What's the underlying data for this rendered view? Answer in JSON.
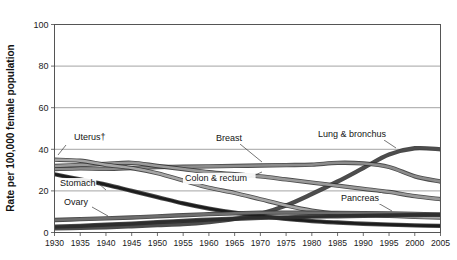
{
  "chart_data": {
    "type": "line",
    "title": "",
    "xlabel": "",
    "ylabel": "Rate per 100,000 female population",
    "xlim": [
      1930,
      2005
    ],
    "ylim": [
      0,
      100
    ],
    "yticks": [
      0,
      20,
      40,
      60,
      80,
      100
    ],
    "xticks": [
      1930,
      1935,
      1940,
      1945,
      1950,
      1955,
      1960,
      1965,
      1970,
      1975,
      1980,
      1985,
      1990,
      1995,
      2000,
      2005
    ],
    "grid": true,
    "legend_position": "in-plot-labels",
    "x": [
      1930,
      1935,
      1940,
      1945,
      1950,
      1955,
      1960,
      1965,
      1970,
      1975,
      1980,
      1985,
      1990,
      1995,
      2000,
      2005
    ],
    "series": [
      {
        "name": "Lung & bronchus",
        "label": "Lung & bronchus",
        "color": "#4d4d4d",
        "values": [
          2.0,
          2.2,
          2.5,
          3.0,
          3.5,
          4.0,
          5.0,
          6.5,
          9.0,
          13.0,
          18.5,
          24.5,
          31.0,
          37.5,
          40.5,
          40.0
        ]
      },
      {
        "name": "Breast",
        "label": "Breast",
        "color": "#8c8c8c",
        "values": [
          30.5,
          30.8,
          30.6,
          31.0,
          31.5,
          31.6,
          31.8,
          32.0,
          32.2,
          32.4,
          32.6,
          33.5,
          33.2,
          31.5,
          27.0,
          24.5
        ]
      },
      {
        "name": "Colon & rectum",
        "label": "Colon & rectum",
        "color": "#9a9a9a",
        "values": [
          32.0,
          32.5,
          33.0,
          33.5,
          32.0,
          30.5,
          29.0,
          28.0,
          27.0,
          25.5,
          24.0,
          22.5,
          21.0,
          19.5,
          17.5,
          16.0
        ]
      },
      {
        "name": "Uterus",
        "label": "Uterus†",
        "color": "#a6a6a6",
        "values": [
          35.0,
          34.5,
          32.5,
          31.0,
          28.5,
          25.0,
          21.5,
          19.0,
          16.0,
          13.0,
          10.5,
          9.0,
          8.5,
          8.0,
          7.5,
          7.2
        ]
      },
      {
        "name": "Stomach",
        "label": "Stomach",
        "color": "#1c1c1c",
        "values": [
          28.0,
          25.5,
          23.0,
          20.0,
          17.0,
          14.0,
          11.5,
          9.5,
          8.0,
          6.5,
          5.5,
          4.8,
          4.2,
          3.8,
          3.4,
          3.2
        ]
      },
      {
        "name": "Ovary",
        "label": "Ovary",
        "color": "#6e6e6e",
        "values": [
          6.0,
          6.4,
          6.8,
          7.2,
          7.8,
          8.3,
          8.8,
          9.2,
          9.5,
          9.6,
          9.5,
          9.4,
          9.3,
          9.2,
          9.0,
          8.6
        ]
      },
      {
        "name": "Pancreas",
        "label": "Pancreas",
        "color": "#2e2e2e",
        "values": [
          2.8,
          3.2,
          3.8,
          4.3,
          5.0,
          5.6,
          6.2,
          6.6,
          7.0,
          7.3,
          7.6,
          7.8,
          8.0,
          8.2,
          8.4,
          8.6
        ]
      }
    ],
    "annotations": [
      {
        "text": "Uterus†",
        "x_px": 74,
        "y_px": 140,
        "leader": [
          66,
          145,
          58,
          155
        ]
      },
      {
        "text": "Stomach",
        "x_px": 60,
        "y_px": 186,
        "leader": [
          98,
          183,
          106,
          190
        ]
      },
      {
        "text": "Ovary",
        "x_px": 64,
        "y_px": 205,
        "leader": [
          92,
          207,
          108,
          216
        ]
      },
      {
        "text": "Colon & rectum",
        "x_px": 185,
        "y_px": 181,
        "leader": [
          248,
          178,
          262,
          172
        ]
      },
      {
        "text": "Breast",
        "x_px": 216,
        "y_px": 141,
        "leader": [
          240,
          144,
          262,
          162
        ]
      },
      {
        "text": "Lung & bronchus",
        "x_px": 318,
        "y_px": 137,
        "leader": [
          384,
          140,
          396,
          148
        ]
      },
      {
        "text": "Pancreas",
        "x_px": 341,
        "y_px": 201,
        "leader": [
          378,
          203,
          392,
          211
        ]
      }
    ]
  },
  "axes": {
    "y_axis_title": "Rate per 100,000 female population",
    "y_tick_labels": [
      "100",
      "80",
      "60",
      "40",
      "20",
      "0"
    ],
    "x_tick_labels": [
      "1930",
      "1935",
      "1940",
      "1945",
      "1950",
      "1955",
      "1960",
      "1965",
      "1970",
      "1975",
      "1980",
      "1985",
      "1990",
      "1995",
      "2000",
      "2005"
    ]
  },
  "colors": {
    "frame": "#555555",
    "grid": "#7d7d7d",
    "text": "#1b1b1b",
    "background": "#ffffff"
  }
}
